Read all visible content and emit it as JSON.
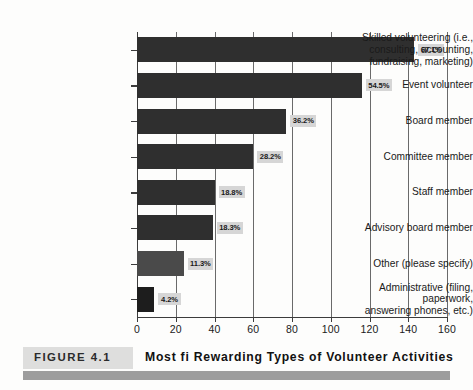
{
  "figure": {
    "tag": "FIGURE 4.1",
    "title": "Most fi Rewarding Types of Volunteer Activities"
  },
  "chart_data": {
    "type": "bar",
    "orientation": "horizontal",
    "title": "Most fi Rewarding Types of Volunteer Activities",
    "xlabel": "",
    "ylabel": "",
    "xlim": [
      0,
      160
    ],
    "xticks": [
      0,
      20,
      40,
      60,
      80,
      100,
      120,
      140,
      160
    ],
    "grid": true,
    "legend": false,
    "categories": [
      "Skilled volunteering (i.e.,\nconsulting, accounting,\nfundraising, marketing)",
      "Event volunteer",
      "Board member",
      "Committee member",
      "Staff member",
      "Advisory board member",
      "Other (please specify)",
      "Administrative (filing,\npaperwork,\nanswering phones, etc.)"
    ],
    "values": [
      143,
      116,
      77,
      60,
      40,
      39,
      24,
      9
    ],
    "labels": [
      "67.1%",
      "54.5%",
      "36.2%",
      "28.2%",
      "18.8%",
      "18.3%",
      "11.3%",
      "4.2%"
    ],
    "percents": [
      67.1,
      54.5,
      36.2,
      28.2,
      18.8,
      18.3,
      11.3,
      4.2
    ]
  },
  "colors": {
    "bar_dark": "#2f2f2f",
    "bar_light": "#4a4a4a",
    "bar_darkest": "#1d1d1d",
    "label_bg": "#d6d6d6",
    "axis": "#3c3c3c",
    "caption_rule": "#9d9d9d",
    "caption_tag_bg": "#dededd"
  }
}
